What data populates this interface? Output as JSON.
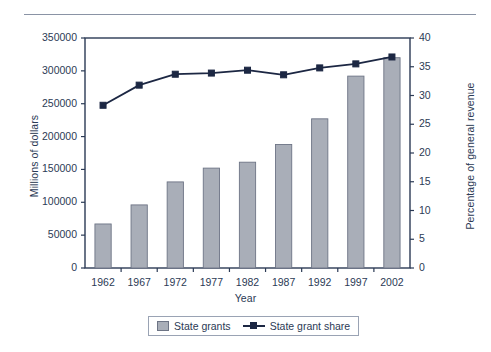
{
  "chart_data": {
    "type": "bar",
    "title": "",
    "subtitle": "",
    "xlabel": "Year",
    "ylabel": "Millions of dollars",
    "y2label": "Percentage of general revenue",
    "categories": [
      "1962",
      "1967",
      "1972",
      "1977",
      "1982",
      "1987",
      "1992",
      "1997",
      "2002"
    ],
    "ylim": [
      0,
      350000
    ],
    "y2lim": [
      0,
      40
    ],
    "yticks": [
      "0",
      "50000",
      "100000",
      "150000",
      "200000",
      "250000",
      "300000",
      "350000"
    ],
    "ytick_values": [
      0,
      50000,
      100000,
      150000,
      200000,
      250000,
      300000,
      350000
    ],
    "y2ticks": [
      "0",
      "5",
      "10",
      "15",
      "20",
      "25",
      "30",
      "35",
      "40"
    ],
    "y2tick_values": [
      0,
      5,
      10,
      15,
      20,
      25,
      30,
      35,
      40
    ],
    "grid": false,
    "legend_position": "bottom-center",
    "series": [
      {
        "name": "State grants",
        "kind": "bar",
        "axis": "left",
        "color": "#a9aeb8",
        "edge_color": "#6d7485",
        "values": [
          67000,
          96000,
          131000,
          152000,
          161000,
          188000,
          227000,
          292000,
          320000
        ]
      },
      {
        "name": "State grant share",
        "kind": "line",
        "axis": "right",
        "color": "#1c2743",
        "marker": "square",
        "values": [
          28.3,
          31.8,
          33.7,
          33.9,
          34.4,
          33.6,
          34.8,
          35.5,
          36.7
        ]
      }
    ]
  },
  "legend": {
    "items": [
      {
        "label": "State grants",
        "type": "bar-swatch"
      },
      {
        "label": "State grant share",
        "type": "line-swatch"
      }
    ]
  },
  "colors": {
    "bar_fill": "#a9aeb8",
    "bar_edge": "#6d7485",
    "line": "#1c2743",
    "axis": "#2b3a55",
    "text": "#2b3a55",
    "rule": "#8a93a5",
    "background": "#ffffff"
  }
}
